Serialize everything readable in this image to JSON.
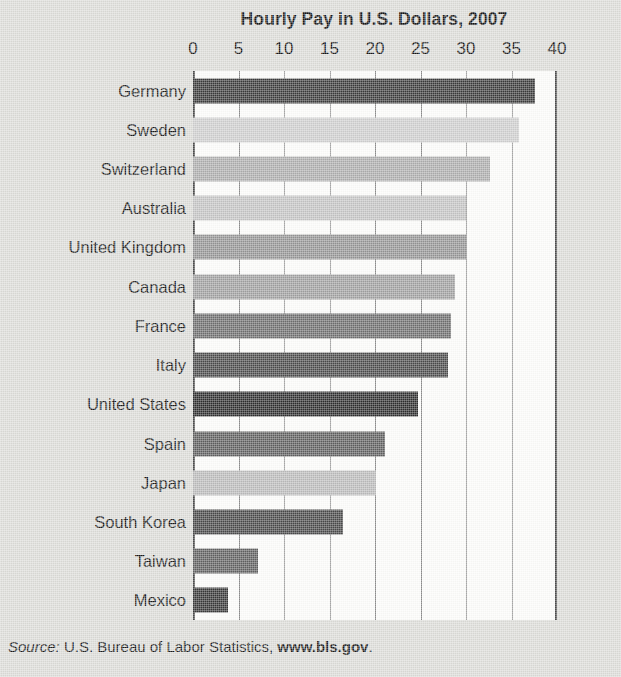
{
  "chart_data": {
    "type": "bar",
    "orientation": "horizontal",
    "title": "Hourly Pay in U.S. Dollars, 2007",
    "xlabel": "",
    "ylabel": "",
    "xlim": [
      0,
      40
    ],
    "xticks": [
      0,
      5,
      10,
      15,
      20,
      25,
      30,
      35,
      40
    ],
    "xtick_labels": [
      "0",
      "5",
      "10",
      "15",
      "20",
      "25",
      "30",
      "35",
      "40"
    ],
    "grid": "vertical",
    "legend": "none",
    "categories": [
      "Germany",
      "Sweden",
      "Switzerland",
      "Australia",
      "United Kingdom",
      "Canada",
      "France",
      "Italy",
      "United States",
      "Spain",
      "Japan",
      "South Korea",
      "Taiwan",
      "Mexico"
    ],
    "values": [
      37.6,
      35.8,
      32.6,
      30.0,
      30.0,
      28.8,
      28.4,
      28.0,
      24.7,
      21.1,
      20.1,
      16.5,
      7.1,
      3.9
    ],
    "bar_colors": [
      "#3a3a3a",
      "#cfcfcf",
      "#adadad",
      "#c4c4c4",
      "#959595",
      "#a0a0a0",
      "#6e6e6e",
      "#4a4a4a",
      "#2e2e2e",
      "#5e5e5e",
      "#bbbbbb",
      "#484848",
      "#606060",
      "#383838"
    ],
    "source_prefix": "Source:",
    "source_text": "U.S. Bureau of Labor Statistics,",
    "source_url": "www.bls.gov",
    "source_suffix": "."
  },
  "style": {
    "plot_background": "#fdfdfb",
    "page_background": "#dcdcd8",
    "gridline_color": "#8e8e8e",
    "axis_color": "#4a4a4a",
    "text_color": "#1a1a1a"
  }
}
